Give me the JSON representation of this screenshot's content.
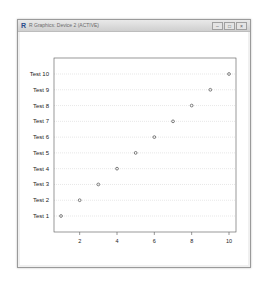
{
  "window": {
    "title": "R Graphics: Device 2 (ACTIVE)",
    "icon": "r-logo-icon",
    "buttons": [
      {
        "name": "minimize",
        "glyph": "–"
      },
      {
        "name": "maximize",
        "glyph": "□"
      },
      {
        "name": "close",
        "glyph": "×"
      }
    ]
  },
  "chart_data": {
    "type": "scatter",
    "subtype": "dotchart",
    "title": "",
    "xlabel": "",
    "ylabel": "",
    "categories": [
      "Test 1",
      "Test 2",
      "Test 3",
      "Test 4",
      "Test 5",
      "Test 6",
      "Test 7",
      "Test 8",
      "Test 9",
      "Test 10"
    ],
    "values": [
      1,
      2,
      3,
      4,
      5,
      6,
      7,
      8,
      9,
      10
    ],
    "x_ticks": [
      2,
      4,
      6,
      8,
      10
    ],
    "xlim": [
      1,
      10
    ],
    "grid": "horizontal dotted lines per category",
    "legend": "none",
    "marker": "open circle"
  }
}
